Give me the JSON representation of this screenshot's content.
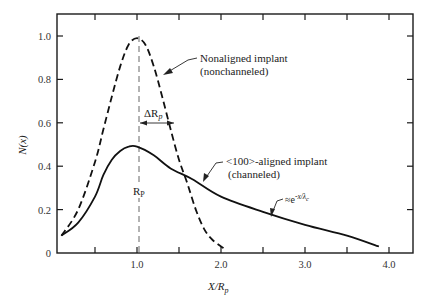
{
  "chart_data": {
    "type": "line",
    "title": "",
    "xlabel": "X/R_p",
    "ylabel": "N(x)",
    "xlim": [
      0.05,
      4.3
    ],
    "ylim": [
      0,
      1.1
    ],
    "grid": false,
    "x_ticks": [
      0.5,
      1.0,
      1.5,
      2.0,
      2.5,
      3.0,
      3.5,
      4.0
    ],
    "x_tick_labels": [
      "1.0",
      "2.0",
      "3.0",
      "4.0"
    ],
    "y_ticks": [
      0,
      0.2,
      0.4,
      0.6,
      0.8,
      1.0
    ],
    "y_tick_labels": [
      "0",
      "0.2",
      "0.4",
      "0.6",
      "0.8",
      "1.0"
    ],
    "series": [
      {
        "name": "Nonaligned implant (nonchanneled)",
        "style": "dashed",
        "x": [
          0.1,
          0.3,
          0.5,
          0.6,
          0.7,
          0.8,
          0.9,
          1.0,
          1.1,
          1.2,
          1.3,
          1.4,
          1.5,
          1.6,
          1.7,
          1.8,
          1.9,
          2.04
        ],
        "y": [
          0.08,
          0.2,
          0.42,
          0.57,
          0.72,
          0.86,
          0.96,
          0.99,
          0.96,
          0.86,
          0.72,
          0.57,
          0.43,
          0.32,
          0.2,
          0.11,
          0.06,
          0.02
        ]
      },
      {
        "name": "<100>-aligned implant (channeled)",
        "style": "solid",
        "x": [
          0.1,
          0.3,
          0.5,
          0.6,
          0.7,
          0.8,
          0.9,
          1.0,
          1.2,
          1.4,
          1.66,
          2.0,
          2.5,
          3.0,
          3.5,
          3.88
        ],
        "y": [
          0.08,
          0.14,
          0.26,
          0.36,
          0.43,
          0.47,
          0.49,
          0.49,
          0.45,
          0.39,
          0.34,
          0.26,
          0.19,
          0.13,
          0.08,
          0.03
        ]
      }
    ],
    "annotations": [
      {
        "text": "Nonaligned implant",
        "line2": "(nonchanneled)",
        "points_to": "dashed curve, X≈1.15"
      },
      {
        "text": "<100>-aligned implant",
        "line2": "(channeled)",
        "points_to": "solid curve, X≈1.75"
      },
      {
        "text": "≈e^(-x/λc)",
        "points_to": "solid curve tail, X≈2.6"
      },
      {
        "text": "ΔR_p",
        "type": "horizontal arrow from X=1.0 to X≈1.45 at N≈0.6"
      },
      {
        "text": "R_P",
        "type": "vertical dashed line at X=1.0"
      }
    ],
    "legend": "none (inline annotations)"
  },
  "labels": {
    "ylabel": "N(x)",
    "xlabel_main": "X/R",
    "xlabel_sub": "p",
    "nonaligned_line1": "Nonaligned implant",
    "nonaligned_line2": "(nonchanneled)",
    "aligned_line1": "<100>-aligned implant",
    "aligned_line2": "(channeled)",
    "exp_approx_prefix": "≈e",
    "exp_approx_sup": "-x/λ",
    "exp_approx_sub": "c",
    "delta_rp_main": "ΔR",
    "delta_rp_sub": "p",
    "rp_main": "R",
    "rp_sub": "P"
  }
}
